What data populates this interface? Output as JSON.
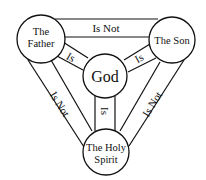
{
  "diagram": {
    "type": "shield-of-the-trinity",
    "colors": {
      "stroke": "#111111",
      "background": "#ffffff",
      "text": "#111111"
    },
    "nodes": {
      "father": {
        "lines": [
          "The",
          "Father"
        ]
      },
      "son": {
        "lines": [
          "The Son"
        ]
      },
      "god": {
        "lines": [
          "God"
        ]
      },
      "spirit": {
        "lines": [
          "The Holy",
          "Spirit"
        ]
      }
    },
    "edges": {
      "father_son": {
        "label": "Is Not"
      },
      "father_spirit": {
        "label": "Is Not"
      },
      "son_spirit": {
        "label": "Is Not"
      },
      "father_god": {
        "label": "Is"
      },
      "son_god": {
        "label": "Is"
      },
      "spirit_god": {
        "label": "Is"
      }
    }
  }
}
